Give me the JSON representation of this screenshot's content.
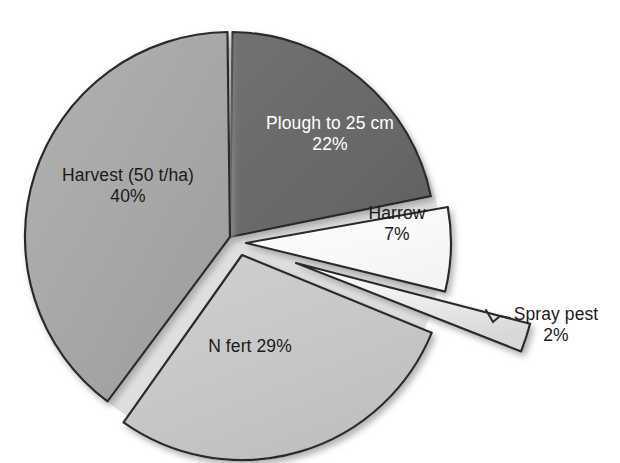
{
  "chart_data": {
    "type": "pie",
    "title": "",
    "subtitle": "",
    "xlabel": "",
    "ylabel": "",
    "legend_position": "none",
    "grid": false,
    "value_unit": "%",
    "total": 100,
    "categories": [
      "Plough to 25 cm",
      "Harrow",
      "Spray pest",
      "N fert",
      "Harvest (50 t/ha)"
    ],
    "values": [
      22,
      7,
      2,
      29,
      40
    ],
    "slices": [
      {
        "label": "Plough to 25 cm",
        "percent_text": "22%",
        "value": 22,
        "color": "#6a6a6a",
        "text_color": "#ffffff",
        "exploded": false,
        "start_angle": 0,
        "end_angle": 79.2
      },
      {
        "label": "Harrow",
        "percent_text": "7%",
        "value": 7,
        "color": "#fdfdfd",
        "text_color": "#1a1a1a",
        "exploded": true,
        "start_angle": 79.2,
        "end_angle": 104.4
      },
      {
        "label": "Spray pest",
        "percent_text": "2%",
        "value": 2,
        "color": "#ededed",
        "text_color": "#1a1a1a",
        "exploded": true,
        "start_angle": 104.4,
        "end_angle": 111.6
      },
      {
        "label": "N fert",
        "percent_text": "29%",
        "value": 29,
        "color": "#c6c6c6",
        "text_color": "#1a1a1a",
        "exploded": true,
        "start_angle": 111.6,
        "end_angle": 216.0
      },
      {
        "label": "Harvest (50 t/ha)",
        "percent_text": "40%",
        "value": 40,
        "color": "#a6a6a6",
        "text_color": "#1a1a1a",
        "exploded": false,
        "start_angle": 216.0,
        "end_angle": 360.0
      }
    ]
  },
  "labels": {
    "plough": {
      "name": "Plough to 25 cm",
      "pct": "22%"
    },
    "harvest": {
      "name": "Harvest (50 t/ha)",
      "pct": "40%"
    },
    "harrow": {
      "name": "Harrow",
      "pct": "7%"
    },
    "nfert": {
      "name": "N fert ",
      "pct": "29%"
    },
    "spray": {
      "name": "Spray pest",
      "pct": "2%"
    }
  },
  "colors": {
    "plough": "#6a6a6a",
    "harvest": "#a6a6a6",
    "nfert": "#c6c6c6",
    "harrow": "#fdfdfd",
    "spray": "#ededed",
    "outline": "#2b2b2b",
    "background": "#ffffff",
    "shadow": "#bdbdbd"
  }
}
